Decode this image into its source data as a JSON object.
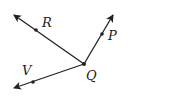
{
  "diagram": {
    "type": "rays",
    "vertex": {
      "name": "Q",
      "label": "Q",
      "x": 84,
      "y": 64,
      "label_x": 86,
      "label_y": 80
    },
    "rays": [
      {
        "name": "R",
        "label": "R",
        "tip_x": 14,
        "tip_y": 15,
        "dot_x": 36,
        "dot_y": 30,
        "label_x": 42,
        "label_y": 27
      },
      {
        "name": "P",
        "label": "P",
        "tip_x": 113,
        "tip_y": 15,
        "dot_x": 102,
        "dot_y": 34,
        "label_x": 108,
        "label_y": 40
      },
      {
        "name": "V",
        "label": "V",
        "tip_x": 14,
        "tip_y": 88,
        "dot_x": 33,
        "dot_y": 82,
        "label_x": 22,
        "label_y": 75
      }
    ],
    "stroke_color": "#222222"
  }
}
